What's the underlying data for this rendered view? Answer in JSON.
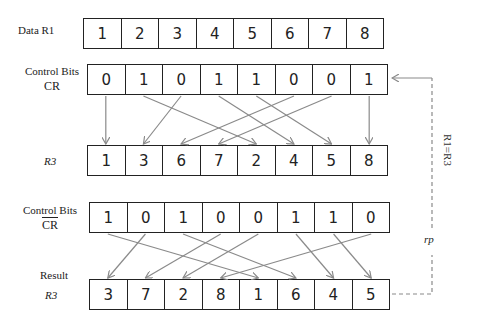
{
  "rows": {
    "data_r1": {
      "label": "Data  R1",
      "values": [
        "1",
        "2",
        "3",
        "4",
        "5",
        "6",
        "7",
        "8"
      ]
    },
    "control_cr": {
      "label_line1": "Control Bits",
      "label_line2": "CR",
      "values": [
        "0",
        "1",
        "0",
        "1",
        "1",
        "0",
        "0",
        "1"
      ]
    },
    "r3_first": {
      "label": "R3",
      "values": [
        "1",
        "3",
        "6",
        "7",
        "2",
        "4",
        "5",
        "8"
      ]
    },
    "control_cr_bar": {
      "label_line1": "Control Bits",
      "label_line2": "CR",
      "values": [
        "1",
        "0",
        "1",
        "0",
        "0",
        "1",
        "1",
        "0"
      ]
    },
    "result_r3": {
      "label_line1": "Result",
      "label_line2": "R3",
      "values": [
        "3",
        "7",
        "2",
        "8",
        "1",
        "6",
        "4",
        "5"
      ]
    }
  },
  "feedback": {
    "label": "R1=R3",
    "sublabel": "rp"
  },
  "mappings": {
    "cr_to_r3": [
      [
        0,
        0
      ],
      [
        2,
        1
      ],
      [
        5,
        2
      ],
      [
        6,
        3
      ],
      [
        1,
        4
      ],
      [
        3,
        5
      ],
      [
        4,
        6
      ],
      [
        7,
        7
      ]
    ],
    "crbar_to_result": [
      [
        1,
        0
      ],
      [
        3,
        1
      ],
      [
        4,
        2
      ],
      [
        7,
        3
      ],
      [
        0,
        4
      ],
      [
        2,
        5
      ],
      [
        5,
        6
      ],
      [
        6,
        7
      ]
    ]
  },
  "colors": {
    "arrow": "#8a8a8a",
    "border": "#222222",
    "dashed": "#8a8a8a"
  }
}
